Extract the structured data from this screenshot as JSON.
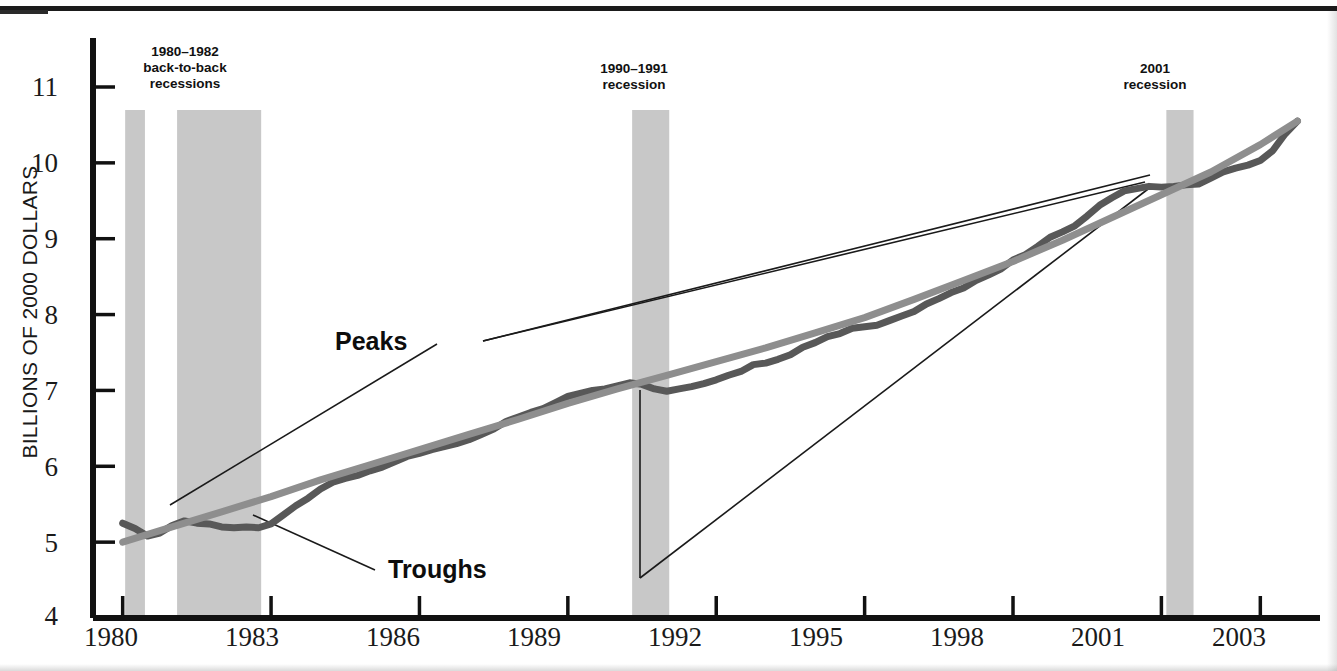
{
  "figure": {
    "background_color": "#ffffff",
    "axis_color": "#111111",
    "band_color": "#c8c8c8"
  },
  "chart_data": {
    "type": "line",
    "title": "",
    "subtitle": "",
    "xlabel": "",
    "ylabel": "BILLIONS OF 2000 DOLLARS",
    "xlim": [
      1979.4,
      2003.6
    ],
    "ylim": [
      4,
      11.4
    ],
    "grid": false,
    "legend_position": "none",
    "xticks": [
      1980,
      1983,
      1986,
      1989,
      1992,
      1995,
      1998,
      2001,
      2003
    ],
    "xtick_labels": [
      "1980",
      "1983",
      "1986",
      "1989",
      "1992",
      "1995",
      "1998",
      "2001",
      "2003"
    ],
    "yticks": [
      4,
      5,
      6,
      7,
      8,
      9,
      10,
      11
    ],
    "ytick_labels": [
      "4",
      "5",
      "6",
      "7",
      "8",
      "9",
      "10",
      "11"
    ],
    "series": [
      {
        "name": "Real GDP",
        "color": "#585858",
        "width": 7,
        "x": [
          1980.0,
          1980.25,
          1980.5,
          1980.75,
          1981.0,
          1981.25,
          1981.5,
          1981.75,
          1982.0,
          1982.25,
          1982.5,
          1982.75,
          1983.0,
          1983.25,
          1983.5,
          1983.75,
          1984.0,
          1984.25,
          1984.5,
          1984.75,
          1985.0,
          1985.25,
          1985.5,
          1985.75,
          1986.0,
          1986.25,
          1986.5,
          1986.75,
          1987.0,
          1987.25,
          1987.5,
          1987.75,
          1988.0,
          1988.25,
          1988.5,
          1988.75,
          1989.0,
          1989.25,
          1989.5,
          1989.75,
          1990.0,
          1990.25,
          1990.5,
          1990.75,
          1991.0,
          1991.25,
          1991.5,
          1991.75,
          1992.0,
          1992.25,
          1992.5,
          1992.75,
          1993.0,
          1993.25,
          1993.5,
          1993.75,
          1994.0,
          1994.25,
          1994.5,
          1994.75,
          1995.0,
          1995.25,
          1995.5,
          1995.75,
          1996.0,
          1996.25,
          1996.5,
          1996.75,
          1997.0,
          1997.25,
          1997.5,
          1997.75,
          1998.0,
          1998.25,
          1998.5,
          1998.75,
          1999.0,
          1999.25,
          1999.5,
          1999.75,
          2000.0,
          2000.25,
          2000.5,
          2000.75,
          2001.0,
          2001.25,
          2001.5,
          2001.75,
          2002.0,
          2002.25,
          2002.5,
          2002.75,
          2003.0,
          2003.25,
          2003.5,
          2003.75
        ],
        "y": [
          5.25,
          5.18,
          5.08,
          5.12,
          5.22,
          5.28,
          5.25,
          5.24,
          5.2,
          5.19,
          5.2,
          5.19,
          5.24,
          5.36,
          5.48,
          5.58,
          5.7,
          5.79,
          5.84,
          5.88,
          5.94,
          5.99,
          6.06,
          6.13,
          6.17,
          6.22,
          6.26,
          6.3,
          6.35,
          6.42,
          6.49,
          6.59,
          6.65,
          6.71,
          6.76,
          6.84,
          6.92,
          6.96,
          7.0,
          7.02,
          7.06,
          7.1,
          7.08,
          7.02,
          6.99,
          7.02,
          7.05,
          7.09,
          7.14,
          7.2,
          7.25,
          7.34,
          7.36,
          7.41,
          7.47,
          7.57,
          7.63,
          7.71,
          7.75,
          7.82,
          7.84,
          7.86,
          7.92,
          7.98,
          8.04,
          8.14,
          8.21,
          8.29,
          8.35,
          8.45,
          8.52,
          8.6,
          8.72,
          8.79,
          8.9,
          9.02,
          9.09,
          9.17,
          9.3,
          9.44,
          9.54,
          9.63,
          9.66,
          9.69,
          9.68,
          9.69,
          9.71,
          9.72,
          9.8,
          9.88,
          9.93,
          9.97,
          10.03,
          10.16,
          10.38,
          10.55
        ],
        "peaks": [
          {
            "year": 1990.25,
            "value": 7.1
          },
          {
            "year": 2000.75,
            "value": 9.69
          }
        ],
        "troughs": [
          {
            "year": 1982.75,
            "value": 5.19
          },
          {
            "year": 1991.0,
            "value": 6.99
          }
        ]
      },
      {
        "name": "Potential GDP",
        "color": "#8e8e8e",
        "width": 7,
        "x": [
          1980.0,
          1981.0,
          1982.0,
          1983.0,
          1984.0,
          1985.0,
          1986.0,
          1987.0,
          1988.0,
          1989.0,
          1990.0,
          1991.0,
          1992.0,
          1993.0,
          1994.0,
          1995.0,
          1996.0,
          1997.0,
          1998.0,
          1999.0,
          2000.0,
          2001.0,
          2002.0,
          2003.0,
          2003.75
        ],
        "y": [
          5.0,
          5.2,
          5.4,
          5.6,
          5.82,
          6.02,
          6.22,
          6.42,
          6.62,
          6.83,
          7.02,
          7.2,
          7.38,
          7.56,
          7.76,
          7.96,
          8.2,
          8.45,
          8.7,
          8.98,
          9.28,
          9.58,
          9.88,
          10.24,
          10.55
        ]
      }
    ],
    "recession_bands": [
      {
        "id": "1980",
        "start": 1980.05,
        "end": 1980.45
      },
      {
        "id": "1981-1982",
        "start": 1981.1,
        "end": 1982.8
      },
      {
        "id": "1990-1991",
        "start": 1990.3,
        "end": 1991.05
      },
      {
        "id": "2001",
        "start": 2001.1,
        "end": 2001.65
      }
    ],
    "band_annotations": [
      {
        "id": "1980-1982",
        "line1": "1980–1982",
        "line2": "back-to-back",
        "line3": "recessions"
      },
      {
        "id": "1990-1991",
        "line1": "1990–1991",
        "line2": "recession",
        "line3": ""
      },
      {
        "id": "2001",
        "line1": "2001",
        "line2": "recession",
        "line3": ""
      }
    ],
    "annotations": [
      {
        "id": "peaks",
        "label": "Peaks"
      },
      {
        "id": "troughs",
        "label": "Troughs"
      }
    ]
  }
}
